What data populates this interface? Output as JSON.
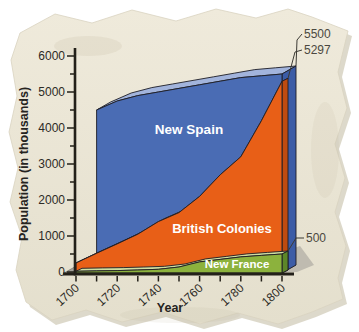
{
  "page": {
    "background": "#ffffff",
    "paper_color": "#ebe6d7"
  },
  "chart_data": {
    "type": "area",
    "title": "",
    "xlabel": "Year",
    "ylabel": "Population (in thousands)",
    "x_range": [
      1700,
      1800
    ],
    "y_range": [
      0,
      6000
    ],
    "y_ticks_labeled": [
      0,
      1000,
      2000,
      3000,
      4000,
      5000,
      6000
    ],
    "y_minor_tick_step": 500,
    "x_ticks_labeled": [
      1700,
      1720,
      1740,
      1760,
      1780,
      1800
    ],
    "x_minor_tick_step": 10,
    "legend_position": "labels-on-areas",
    "grid": false,
    "series": [
      {
        "name": "New Spain",
        "end_label": "5500",
        "color": "#4a6cb4",
        "top_color": "#a2b4dc",
        "side_color": "#3c5ca6",
        "x": [
          1710,
          1720,
          1730,
          1740,
          1750,
          1760,
          1770,
          1780,
          1790,
          1800
        ],
        "values": [
          4500,
          4750,
          4900,
          5000,
          5100,
          5200,
          5300,
          5400,
          5450,
          5500
        ]
      },
      {
        "name": "British Colonies",
        "end_label": "5297",
        "color": "#e85f17",
        "top_color": "#f0a473",
        "side_color": "#bf4b10",
        "x": [
          1700,
          1710,
          1720,
          1730,
          1740,
          1750,
          1760,
          1770,
          1780,
          1790,
          1800
        ],
        "values": [
          250,
          520,
          780,
          1050,
          1400,
          1650,
          2100,
          2700,
          3200,
          4200,
          5297
        ]
      },
      {
        "name": "New France",
        "end_label": "500",
        "color": "#8cb23d",
        "top_color": "#cedda0",
        "side_color": "#5d8729",
        "x": [
          1700,
          1710,
          1720,
          1730,
          1740,
          1750,
          1760,
          1770,
          1780,
          1790,
          1800
        ],
        "values": [
          20,
          30,
          40,
          55,
          75,
          140,
          280,
          350,
          420,
          460,
          500
        ]
      }
    ],
    "floor_color": "#a5a29a",
    "shadow_color": "#b5b2a7"
  }
}
